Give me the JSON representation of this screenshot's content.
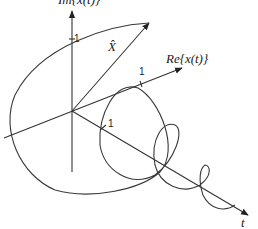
{
  "diagram": {
    "axes": {
      "vertical_label": "Im{x(t)}",
      "real_label": "Re{x(t)}",
      "time_label": "t",
      "phasor_label": "X̂"
    },
    "ticks": {
      "vertical_one": "1",
      "real_one": "1",
      "time_one": "1"
    },
    "colors": {
      "line": "#333333",
      "background": "#ffffff"
    }
  }
}
